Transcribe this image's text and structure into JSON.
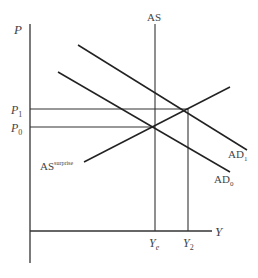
{
  "diagram": {
    "type": "AS-AD model",
    "axes": {
      "y_label": "P",
      "x_label": "Y"
    },
    "price_levels": [
      {
        "id": "P1",
        "base": "P",
        "sub": "1"
      },
      {
        "id": "P0",
        "base": "P",
        "sub": "0"
      }
    ],
    "output_levels": [
      {
        "id": "Ye",
        "base": "Y",
        "sub": "e"
      },
      {
        "id": "Y2",
        "base": "Y",
        "sub": "2"
      }
    ],
    "curves": {
      "as_vertical": {
        "label": "AS"
      },
      "as_surprise": {
        "base": "AS",
        "sup": "surprise"
      },
      "ad1": {
        "base": "AD",
        "sub": "1"
      },
      "ad0": {
        "base": "AD",
        "sub": "0"
      }
    },
    "colors": {
      "line": "#222222",
      "text": "#444444",
      "background": "#ffffff"
    }
  }
}
